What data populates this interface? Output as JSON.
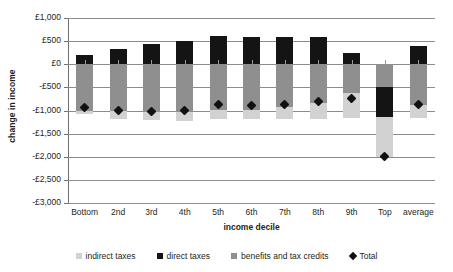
{
  "chart_data": {
    "type": "bar",
    "title": "",
    "xlabel": "income decile",
    "ylabel": "change in income",
    "ylim": [
      -3000,
      1000
    ],
    "ytick_step": 500,
    "stacked": true,
    "grid": true,
    "legend_position": "bottom",
    "currency": "£",
    "categories": [
      "Bottom",
      "2nd",
      "3rd",
      "4th",
      "5th",
      "6th",
      "7th",
      "8th",
      "9th",
      "Top",
      "average"
    ],
    "ytick_labels": [
      "£1,000",
      "£500",
      "£0",
      "-£500",
      "-£1,000",
      "-£1,500",
      "-£2,000",
      "-£2,500",
      "-£3,000"
    ],
    "ytick_values": [
      1000,
      500,
      0,
      -500,
      -1000,
      -1500,
      -2000,
      -2500,
      -3000
    ],
    "series": [
      {
        "name": "indirect taxes",
        "color": "#d2d2d2",
        "values": [
          -1080,
          -1190,
          -1210,
          -1220,
          -1190,
          -1180,
          -1190,
          -1190,
          -1160,
          -2000,
          -1160
        ]
      },
      {
        "name": "direct taxes",
        "color": "#141414",
        "values": [
          200,
          330,
          430,
          500,
          610,
          590,
          600,
          580,
          240,
          -1150,
          400
        ]
      },
      {
        "name": "benefits and tax credits",
        "color": "#8f8f8f",
        "values": [
          -1000,
          -1020,
          -1040,
          -1030,
          -990,
          -980,
          -930,
          -840,
          -630,
          -500,
          -880
        ]
      },
      {
        "name": "Total",
        "color": "#111111",
        "marker": "diamond",
        "values": [
          -930,
          -1000,
          -1020,
          -1010,
          -880,
          -890,
          -870,
          -800,
          -740,
          -2000,
          -880
        ]
      }
    ]
  },
  "axes": {
    "ylabel": "change in income",
    "xlabel": "income decile"
  },
  "legend": {
    "items": [
      {
        "label": "indirect taxes",
        "swatch": "indirect-taxes-swatch"
      },
      {
        "label": "direct taxes",
        "swatch": "direct-taxes-swatch"
      },
      {
        "label": "benefits and tax credits",
        "swatch": "benefits-and-tax-credits-swatch"
      },
      {
        "label": "Total",
        "swatch": "total-marker-swatch"
      }
    ]
  }
}
